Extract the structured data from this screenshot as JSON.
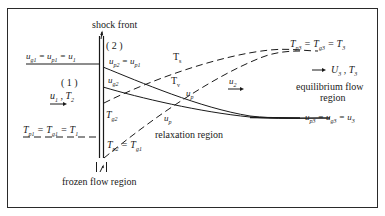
{
  "labels": {
    "shock_front": "shock front",
    "region_1": "( 1 )",
    "region_2": "( 2 )",
    "u_upstream": "u g1 = u p1 = u 1",
    "u1_T1": "u 1 , T 2",
    "T_upstream": "T p1 = T g1 = T 1",
    "u_p2": "u p2 = u p1",
    "u_g2": "u g2",
    "T_g2": "T g2",
    "T_p2": "T p2 = T g1",
    "T_s": "T s",
    "T_v": "T v",
    "u_p_upper": "u p",
    "u_p_lower": "u p",
    "u_2": "u 2",
    "T_downstream": "T p3 = T g3 = T 3",
    "U3_T3": "U 3 , T 3",
    "equilibrium_region": "equilibrium flow region",
    "equilibrium_line1": "equilibrium flow",
    "equilibrium_line2": "region",
    "u_downstream": "u p3 = u g3 = u 3",
    "relaxation_region": "relaxation region",
    "frozen_region": "frozen flow region"
  },
  "colors": {
    "line": "#1a1a1a",
    "frame": "#2a2a2a",
    "background": "#ffffff"
  }
}
